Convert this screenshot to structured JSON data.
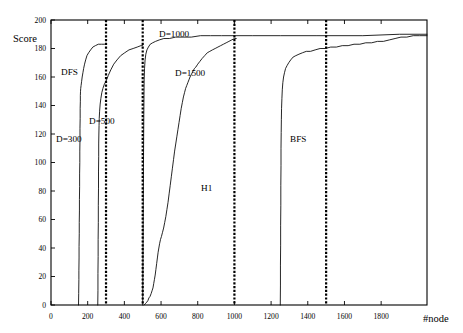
{
  "chart_data": {
    "type": "line",
    "title": "",
    "xlabel": "#node",
    "ylabel": "Score",
    "xlim": [
      0,
      2050
    ],
    "ylim": [
      0,
      200
    ],
    "grid": false,
    "legend_position": "inline-annotations",
    "x_ticks": [
      0,
      200,
      400,
      600,
      800,
      1000,
      1200,
      1400,
      1600,
      1800
    ],
    "y_ticks": [
      0,
      20,
      40,
      60,
      80,
      100,
      120,
      140,
      160,
      180,
      200
    ],
    "annotations": [
      {
        "text": "Score",
        "x_px": 13,
        "y_px": 42
      },
      {
        "text": "DFS",
        "x_px": 61,
        "y_px": 75
      },
      {
        "text": "D=300",
        "x_px": 56,
        "y_px": 142
      },
      {
        "text": "D=500",
        "x_px": 89,
        "y_px": 124
      },
      {
        "text": "D=1000",
        "x_px": 159,
        "y_px": 37
      },
      {
        "text": "D=1500",
        "x_px": 175,
        "y_px": 76
      },
      {
        "text": "H1",
        "x_px": 201,
        "y_px": 191
      },
      {
        "text": "BFS",
        "x_px": 290,
        "y_px": 142
      },
      {
        "text": "#node",
        "x_px": 423,
        "y_px": 322
      }
    ],
    "vertical_markers": [
      {
        "name": "D=300",
        "x": 300,
        "style": "dashed"
      },
      {
        "name": "D=500",
        "x": 500,
        "style": "dashed"
      },
      {
        "name": "D=1000",
        "x": 1000,
        "style": "dashed"
      },
      {
        "name": "D=1500",
        "x": 1500,
        "style": "dashed"
      }
    ],
    "series": [
      {
        "name": "DFS",
        "label": "DFS",
        "points": [
          [
            150,
            0
          ],
          [
            151,
            8
          ],
          [
            152,
            18
          ],
          [
            152,
            24
          ],
          [
            153,
            33
          ],
          [
            153,
            41
          ],
          [
            154,
            50
          ],
          [
            154,
            58
          ],
          [
            155,
            66
          ],
          [
            155,
            74
          ],
          [
            156,
            83
          ],
          [
            156,
            92
          ],
          [
            157,
            100
          ],
          [
            157,
            108
          ],
          [
            158,
            116
          ],
          [
            158,
            124
          ],
          [
            159,
            131
          ],
          [
            159,
            138
          ],
          [
            160,
            143
          ],
          [
            160,
            147
          ],
          [
            161,
            150
          ],
          [
            162,
            152
          ],
          [
            164,
            154
          ],
          [
            167,
            157
          ],
          [
            170,
            160
          ],
          [
            174,
            163
          ],
          [
            178,
            166
          ],
          [
            183,
            169
          ],
          [
            189,
            172
          ],
          [
            196,
            175
          ],
          [
            205,
            177
          ],
          [
            216,
            179
          ],
          [
            228,
            181
          ],
          [
            242,
            182
          ],
          [
            258,
            183
          ],
          [
            275,
            183
          ],
          [
            292,
            183
          ],
          [
            300,
            183
          ]
        ]
      },
      {
        "name": "D=500",
        "label": "D=500",
        "points": [
          [
            255,
            0
          ],
          [
            256,
            10
          ],
          [
            256,
            22
          ],
          [
            257,
            34
          ],
          [
            257,
            46
          ],
          [
            258,
            58
          ],
          [
            258,
            70
          ],
          [
            259,
            82
          ],
          [
            259,
            94
          ],
          [
            260,
            104
          ],
          [
            260,
            113
          ],
          [
            261,
            120
          ],
          [
            262,
            126
          ],
          [
            263,
            131
          ],
          [
            265,
            136
          ],
          [
            268,
            141
          ],
          [
            272,
            145
          ],
          [
            277,
            149
          ],
          [
            283,
            152
          ],
          [
            291,
            155
          ],
          [
            300,
            157
          ],
          [
            312,
            161
          ],
          [
            326,
            165
          ],
          [
            342,
            169
          ],
          [
            360,
            172
          ],
          [
            380,
            175
          ],
          [
            402,
            177
          ],
          [
            425,
            179
          ],
          [
            448,
            180
          ],
          [
            470,
            181
          ],
          [
            490,
            182
          ],
          [
            500,
            182
          ]
        ]
      },
      {
        "name": "D=1000",
        "label": "D=1000",
        "points": [
          [
            500,
            0
          ],
          [
            501,
            20
          ],
          [
            502,
            45
          ],
          [
            503,
            70
          ],
          [
            504,
            95
          ],
          [
            505,
            115
          ],
          [
            506,
            133
          ],
          [
            507,
            148
          ],
          [
            508,
            158
          ],
          [
            510,
            166
          ],
          [
            513,
            172
          ],
          [
            517,
            176
          ],
          [
            523,
            179
          ],
          [
            531,
            181
          ],
          [
            541,
            183
          ],
          [
            554,
            184
          ],
          [
            570,
            185
          ],
          [
            590,
            186
          ],
          [
            615,
            187
          ],
          [
            645,
            187
          ],
          [
            680,
            188
          ],
          [
            720,
            188
          ],
          [
            765,
            188
          ],
          [
            815,
            189
          ],
          [
            870,
            189
          ],
          [
            930,
            189
          ],
          [
            1000,
            189
          ],
          [
            1100,
            189
          ],
          [
            1250,
            189
          ],
          [
            1450,
            189
          ],
          [
            1700,
            189
          ],
          [
            1900,
            190
          ],
          [
            2050,
            190
          ]
        ]
      },
      {
        "name": "H1",
        "label": "H1",
        "points": [
          [
            508,
            0
          ],
          [
            515,
            1
          ],
          [
            522,
            2
          ],
          [
            528,
            3
          ],
          [
            534,
            5
          ],
          [
            540,
            6
          ],
          [
            546,
            8
          ],
          [
            551,
            10
          ],
          [
            556,
            12
          ],
          [
            560,
            15
          ],
          [
            564,
            18
          ],
          [
            568,
            21
          ],
          [
            572,
            25
          ],
          [
            576,
            29
          ],
          [
            580,
            33
          ],
          [
            584,
            37
          ],
          [
            588,
            40
          ],
          [
            592,
            43
          ],
          [
            597,
            46
          ],
          [
            602,
            48
          ],
          [
            608,
            51
          ],
          [
            614,
            54
          ],
          [
            620,
            58
          ],
          [
            626,
            62
          ],
          [
            632,
            67
          ],
          [
            638,
            72
          ],
          [
            644,
            78
          ],
          [
            650,
            84
          ],
          [
            656,
            90
          ],
          [
            662,
            96
          ],
          [
            668,
            102
          ],
          [
            674,
            108
          ],
          [
            680,
            113
          ],
          [
            686,
            118
          ],
          [
            692,
            123
          ],
          [
            698,
            128
          ],
          [
            704,
            133
          ],
          [
            710,
            138
          ],
          [
            716,
            142
          ],
          [
            722,
            146
          ],
          [
            728,
            149
          ],
          [
            734,
            152
          ],
          [
            740,
            154
          ],
          [
            746,
            156
          ],
          [
            752,
            158
          ],
          [
            758,
            160
          ],
          [
            766,
            162
          ],
          [
            774,
            164
          ],
          [
            782,
            166
          ],
          [
            790,
            167
          ],
          [
            800,
            169
          ],
          [
            812,
            171
          ],
          [
            824,
            173
          ],
          [
            838,
            175
          ],
          [
            852,
            177
          ],
          [
            866,
            178
          ],
          [
            880,
            179
          ],
          [
            895,
            180
          ],
          [
            910,
            181
          ],
          [
            925,
            182
          ],
          [
            940,
            183
          ],
          [
            955,
            184
          ],
          [
            970,
            185
          ],
          [
            985,
            186
          ],
          [
            1000,
            187
          ],
          [
            1010,
            187
          ]
        ]
      },
      {
        "name": "BFS",
        "label": "BFS",
        "points": [
          [
            1250,
            0
          ],
          [
            1251,
            14
          ],
          [
            1251,
            28
          ],
          [
            1252,
            42
          ],
          [
            1252,
            56
          ],
          [
            1253,
            70
          ],
          [
            1253,
            84
          ],
          [
            1254,
            98
          ],
          [
            1254,
            110
          ],
          [
            1255,
            121
          ],
          [
            1256,
            130
          ],
          [
            1257,
            138
          ],
          [
            1259,
            145
          ],
          [
            1261,
            151
          ],
          [
            1264,
            156
          ],
          [
            1268,
            160
          ],
          [
            1273,
            163
          ],
          [
            1279,
            166
          ],
          [
            1287,
            168
          ],
          [
            1296,
            170
          ],
          [
            1307,
            172
          ],
          [
            1320,
            174
          ],
          [
            1335,
            175
          ],
          [
            1352,
            176
          ],
          [
            1371,
            177
          ],
          [
            1392,
            178
          ],
          [
            1415,
            178
          ],
          [
            1440,
            179
          ],
          [
            1467,
            180
          ],
          [
            1495,
            180
          ],
          [
            1525,
            181
          ],
          [
            1556,
            181
          ],
          [
            1588,
            182
          ],
          [
            1620,
            182
          ],
          [
            1652,
            183
          ],
          [
            1684,
            183
          ],
          [
            1716,
            184
          ],
          [
            1748,
            184
          ],
          [
            1780,
            185
          ],
          [
            1812,
            185
          ],
          [
            1844,
            186
          ],
          [
            1876,
            187
          ],
          [
            1908,
            188
          ],
          [
            1940,
            188
          ],
          [
            1975,
            189
          ],
          [
            2010,
            189
          ],
          [
            2050,
            189
          ]
        ]
      }
    ]
  },
  "plot_geometry": {
    "left_px": 51,
    "right_px": 427,
    "top_px": 20,
    "bottom_px": 305
  }
}
